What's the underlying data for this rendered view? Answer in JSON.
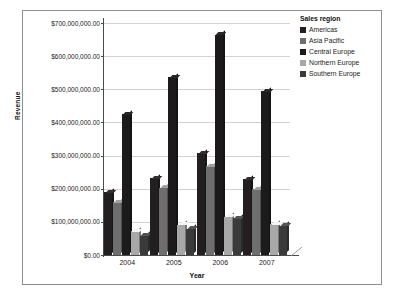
{
  "chart_data": {
    "type": "bar",
    "title": "",
    "xlabel": "Year",
    "ylabel": "Revenue",
    "categories": [
      "2004",
      "2005",
      "2006",
      "2007"
    ],
    "ylim": [
      0,
      700000000
    ],
    "grid": true,
    "legend_position": "right",
    "legend_title": "Sales region",
    "y_tick_labels": [
      "$700,000,000.00",
      "$600,000,000.00",
      "$500,000,000.00",
      "$400,000,000.00",
      "$300,000,000.00",
      "$200,000,000.00",
      "$100,000,000.00",
      "$0.00"
    ],
    "y_tick_values": [
      700000000,
      600000000,
      500000000,
      400000000,
      300000000,
      200000000,
      100000000,
      0
    ],
    "series": [
      {
        "name": "Americas",
        "color": "#231f20",
        "values": [
          190000000,
          232000000,
          307000000,
          228000000
        ]
      },
      {
        "name": "Asia Pacific",
        "color": "#6e6e6e",
        "values": [
          160000000,
          203000000,
          268000000,
          198000000
        ]
      },
      {
        "name": "Central Europe",
        "color": "#1c1a1a",
        "values": [
          424000000,
          536000000,
          665000000,
          494000000
        ]
      },
      {
        "name": "Northern Europe",
        "color": "#a8a8a8",
        "values": [
          72000000,
          92000000,
          116000000,
          93000000
        ]
      },
      {
        "name": "Southern Europe",
        "color": "#3a3a3a",
        "values": [
          58000000,
          80000000,
          112000000,
          88000000
        ]
      }
    ]
  },
  "legend": {
    "title": "Sales region",
    "items": [
      {
        "label": "Americas",
        "color": "#231f20"
      },
      {
        "label": "Asia Pacific",
        "color": "#6e6e6e"
      },
      {
        "label": "Central Europe",
        "color": "#1c1a1a"
      },
      {
        "label": "Northern Europe",
        "color": "#a8a8a8"
      },
      {
        "label": "Southern Europe",
        "color": "#3a3a3a"
      }
    ]
  },
  "colors": {
    "gridline": "#d2d2d2",
    "axis": "#4a4a4a",
    "frame": "#8e8e8e",
    "text": "#1a1a1a",
    "background": "#ffffff"
  }
}
